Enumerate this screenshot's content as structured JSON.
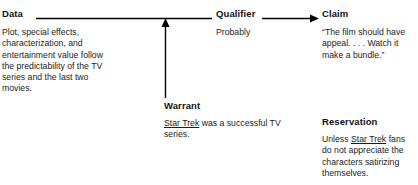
{
  "diagram": {
    "line_color": "#000000",
    "text_color": "#1a1a1a"
  },
  "nodes": {
    "data": {
      "heading": "Data",
      "body": "Plot, special effects, characterization, and entertainment value follow the predictability of the TV series and the last two movies."
    },
    "qualifier": {
      "heading": "Qualifier",
      "body": "Probably"
    },
    "claim": {
      "heading": "Claim",
      "body": "“The film should have appeal. . . . Watch it make a bundle.”"
    },
    "warrant": {
      "heading": "Warrant",
      "body_prefix": "",
      "body_underlined": "Star Trek",
      "body_suffix": " was a successful TV series."
    },
    "reservation": {
      "heading": "Reservation",
      "body_prefix": "Unless ",
      "body_underlined": "Star Trek",
      "body_suffix": " fans do not appreciate the characters satirizing themselves."
    }
  },
  "connectors": {
    "data_to_qualifier": "horizontal-line",
    "qualifier_to_claim": "arrow-right",
    "warrant_to_main": "arrow-up"
  }
}
